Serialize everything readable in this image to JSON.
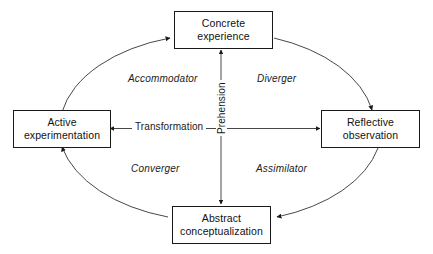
{
  "diagram": {
    "stroke_color": "#1a1a1a",
    "background_color": "#ffffff",
    "nodes": [
      {
        "id": "concrete-experience",
        "label": "Concrete\nexperience",
        "position": "top"
      },
      {
        "id": "reflective-observation",
        "label": "Reflective\nobservation",
        "position": "right"
      },
      {
        "id": "abstract-conceptualization",
        "label": "Abstract\nconceptualization",
        "position": "bottom"
      },
      {
        "id": "active-experimentation",
        "label": "Active\nexperimentation",
        "position": "left"
      }
    ],
    "quadrant_labels": [
      {
        "id": "accommodator",
        "label": "Accommodator",
        "quadrant": "top-left"
      },
      {
        "id": "diverger",
        "label": "Diverger",
        "quadrant": "top-right"
      },
      {
        "id": "converger",
        "label": "Converger",
        "quadrant": "bottom-left"
      },
      {
        "id": "assimilator",
        "label": "Assimilator",
        "quadrant": "bottom-right"
      }
    ],
    "axes": [
      {
        "id": "transformation",
        "label": "Transformation",
        "orientation": "horizontal"
      },
      {
        "id": "prehension",
        "label": "Prehension",
        "orientation": "vertical"
      }
    ]
  }
}
